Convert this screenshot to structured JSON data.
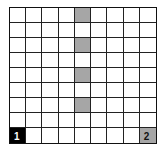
{
  "grid": {
    "rows": 9,
    "cols": 9,
    "colors": {
      "gray": "#a6a6a6",
      "black": "#000000",
      "white": "#ffffff",
      "line": "#222222"
    },
    "shaded_cells": [
      {
        "row": 0,
        "col": 4,
        "fill": "gray"
      },
      {
        "row": 2,
        "col": 4,
        "fill": "gray"
      },
      {
        "row": 4,
        "col": 4,
        "fill": "gray"
      },
      {
        "row": 6,
        "col": 4,
        "fill": "gray"
      },
      {
        "row": 8,
        "col": 0,
        "fill": "black",
        "label": "1"
      },
      {
        "row": 8,
        "col": 8,
        "fill": "gray",
        "label": "2"
      }
    ]
  }
}
